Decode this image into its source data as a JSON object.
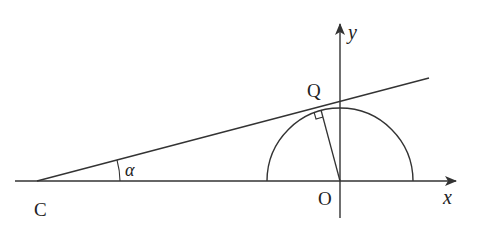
{
  "diagram": {
    "type": "geometry",
    "labels": {
      "point_c": "C",
      "point_o": "O",
      "point_q": "Q",
      "angle": "α",
      "x_axis": "x",
      "y_axis": "y"
    },
    "colors": {
      "stroke": "#333333",
      "background": "#ffffff"
    }
  }
}
